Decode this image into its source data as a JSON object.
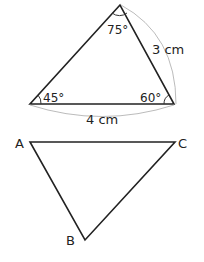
{
  "triangle1": {
    "angles": {
      "top": "75°",
      "left": "45°",
      "right": "60°"
    },
    "sides": {
      "right": "3 cm",
      "bottom": "4 cm"
    }
  },
  "triangle2": {
    "vertices": {
      "a": "A",
      "b": "B",
      "c": "C"
    }
  }
}
